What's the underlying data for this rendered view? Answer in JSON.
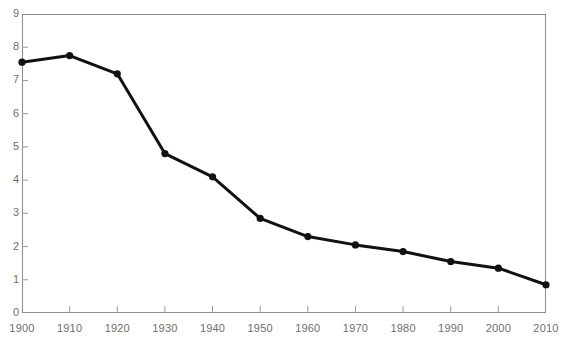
{
  "chart_data": {
    "type": "line",
    "title": "",
    "subtitle": "",
    "xlabel": "",
    "ylabel": "",
    "x": [
      1900,
      1910,
      1920,
      1930,
      1940,
      1950,
      1960,
      1970,
      1980,
      1990,
      2000,
      2010
    ],
    "values": [
      7.55,
      7.75,
      7.2,
      4.8,
      4.1,
      2.85,
      2.3,
      2.05,
      1.85,
      1.55,
      1.35,
      0.85
    ],
    "series": [
      {
        "name": "",
        "values": [
          7.55,
          7.75,
          7.2,
          4.8,
          4.1,
          2.85,
          2.3,
          2.05,
          1.85,
          1.55,
          1.35,
          0.85
        ]
      }
    ],
    "xlim": [
      1900,
      2010
    ],
    "ylim": [
      0,
      9
    ],
    "xticks": [
      1900,
      1910,
      1920,
      1930,
      1940,
      1950,
      1960,
      1970,
      1980,
      1990,
      2000,
      2010
    ],
    "yticks": [
      0,
      1,
      2,
      3,
      4,
      5,
      6,
      7,
      8,
      9
    ],
    "xtick_labels": [
      "1900",
      "1910",
      "1920",
      "1930",
      "1940",
      "1950",
      "1960",
      "1970",
      "1980",
      "1990",
      "2000",
      "2010"
    ],
    "ytick_labels": [
      "0",
      "1",
      "2",
      "3",
      "4",
      "5",
      "6",
      "7",
      "8",
      "9"
    ],
    "grid": false,
    "legend": null,
    "legend_position": "none",
    "annotations": [],
    "colors": {
      "line": "#111111",
      "marker": "#111111",
      "frame": "#8c8c8c",
      "tick": "#9a9a9a",
      "tick_text": "#6e6e6e",
      "background": "#ffffff"
    },
    "marker_style": "circle",
    "line_width": 3
  }
}
